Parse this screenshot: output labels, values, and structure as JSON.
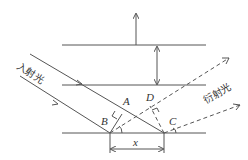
{
  "diagram": {
    "title": "",
    "labels": {
      "incident": "入射光",
      "diffracted": "衍射光",
      "point_a": "A",
      "point_b": "B",
      "point_c": "C",
      "point_d": "D",
      "spacing": "x"
    },
    "colors": {
      "line": "#555555",
      "text": "#333333",
      "background": "#ffffff"
    }
  }
}
